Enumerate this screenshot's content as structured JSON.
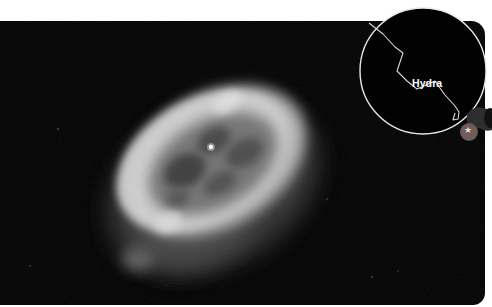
{
  "image": {
    "subject": "planetary-nebula",
    "background_color": "#020202",
    "page_color": "#ffffff"
  },
  "inset": {
    "constellation_label": "Hydra",
    "circle_color": "#e8e8e8",
    "line_color": "#d9d9d9",
    "marker_icon": "telescope-icon",
    "marker_glyph": "★"
  }
}
